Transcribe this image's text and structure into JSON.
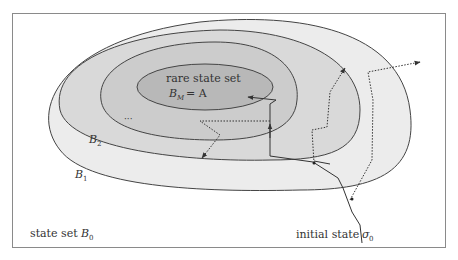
{
  "diagram": {
    "type": "nested-set-diagram",
    "frame": {
      "x": 12,
      "y": 13,
      "width": 433,
      "height": 234,
      "stroke": "#888888"
    },
    "regions": [
      {
        "id": "B0",
        "label": "state set",
        "symbol": "B",
        "subscript": "0",
        "fill": "#ffffff"
      },
      {
        "id": "B1",
        "symbol": "B",
        "subscript": "1",
        "fill": "#ececec"
      },
      {
        "id": "B2",
        "symbol": "B",
        "subscript": "2",
        "fill": "#d9d9d9"
      },
      {
        "id": "B3",
        "fill": "#cccccc",
        "label": "..."
      },
      {
        "id": "BM",
        "label": "rare state set",
        "formula_symbol": "B",
        "formula_subscript": "M",
        "formula_rhs": "= A",
        "fill": "#b8b8b8"
      }
    ],
    "labels": {
      "rare_title": "rare state set",
      "rare_formula_B": "B",
      "rare_formula_sub": "M",
      "rare_formula_rhs": "= A",
      "ellipsis": "···",
      "b2_B": "B",
      "b2_sub": "2",
      "b1_B": "B",
      "b1_sub": "1",
      "b0_text": "state set",
      "b0_B": "B",
      "b0_sub": "0",
      "initial_text": "initial state",
      "initial_sigma": "σ",
      "initial_sub": "0"
    },
    "colors": {
      "stroke": "#444444",
      "b1": "#ececec",
      "b2": "#d9d9d9",
      "b3": "#cbcbcb",
      "bm": "#b8b8b8",
      "path": "#333333"
    },
    "paths": [
      {
        "name": "main-trajectory",
        "style": "solid",
        "description": "from initial state upward through B1, B2 boundaries into rare set A"
      },
      {
        "name": "branch-into-rare",
        "style": "solid-arrow",
        "description": "arrow pointing into B_M = A"
      },
      {
        "name": "dotted-trajectory-left",
        "style": "dotted",
        "description": "dotted branch ending with arrow downward-left"
      },
      {
        "name": "dotted-trajectory-upper",
        "style": "dotted",
        "description": "dotted branch exiting upward"
      },
      {
        "name": "dotted-trajectory-right",
        "style": "dotted",
        "description": "dotted branch exiting to the right beyond B0 region"
      }
    ]
  }
}
